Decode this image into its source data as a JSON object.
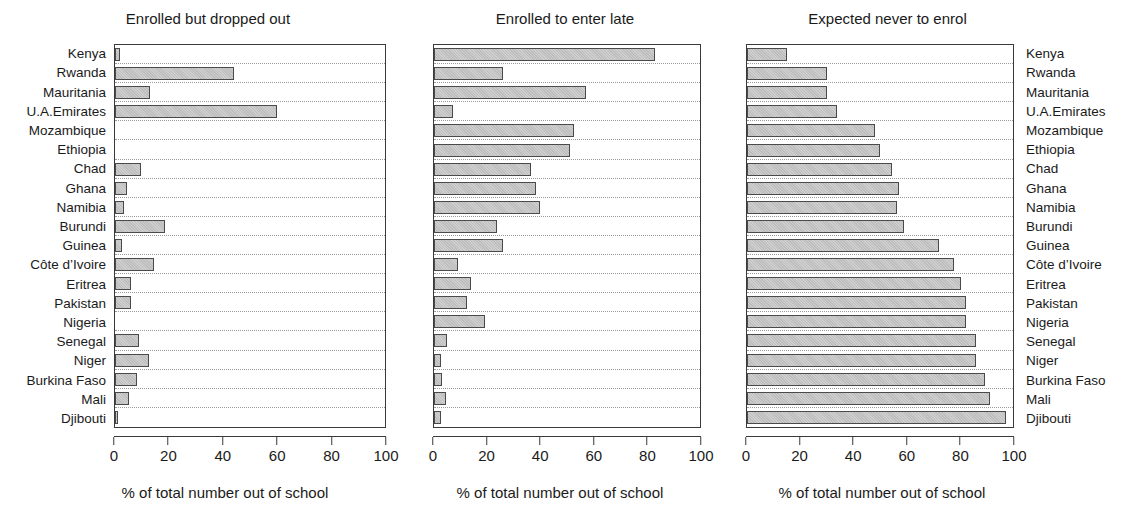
{
  "figure": {
    "xaxis_title": "% of total number out of school",
    "xticks": [
      0,
      20,
      40,
      60,
      80,
      100
    ],
    "xlim": [
      0,
      100
    ],
    "categories": [
      "Kenya",
      "Rwanda",
      "Mauritania",
      "U.A.Emirates",
      "Mozambique",
      "Ethiopia",
      "Chad",
      "Ghana",
      "Namibia",
      "Burundi",
      "Guinea",
      "Côte d’Ivoire",
      "Eritrea",
      "Pakistan",
      "Nigeria",
      "Senegal",
      "Niger",
      "Burkina Faso",
      "Mali",
      "Djibouti"
    ],
    "panel_titles": [
      "Enrolled but dropped out",
      "Enrolled to enter late",
      "Expected never to enrol"
    ],
    "colors": {
      "bar_fill": "#c6c6c6",
      "bar_edge": "#4a4a4a",
      "axis": "#3a3a3a",
      "gridline": "#9a9a9a",
      "background": "#ffffff",
      "text": "#1a1a1a"
    }
  },
  "chart_data": {
    "type": "bar",
    "orientation": "horizontal",
    "xlabel": "% of total number out of school",
    "ylabel": "",
    "xlim": [
      0,
      100
    ],
    "xticks": [
      0,
      20,
      40,
      60,
      80,
      100
    ],
    "grid": "dotted horizontal separators between categories",
    "legend": "none",
    "categories": [
      "Kenya",
      "Rwanda",
      "Mauritania",
      "U.A.Emirates",
      "Mozambique",
      "Ethiopia",
      "Chad",
      "Ghana",
      "Namibia",
      "Burundi",
      "Guinea",
      "Côte d’Ivoire",
      "Eritrea",
      "Pakistan",
      "Nigeria",
      "Senegal",
      "Niger",
      "Burkina Faso",
      "Mali",
      "Djibouti"
    ],
    "panels": [
      {
        "title": "Enrolled but dropped out",
        "values": [
          2,
          44,
          13,
          60,
          0,
          0,
          9.5,
          4.5,
          3.5,
          18.5,
          2.5,
          14.5,
          6,
          6,
          0,
          9,
          12.5,
          8,
          5,
          1
        ]
      },
      {
        "title": "Enrolled to enter late",
        "values": [
          83,
          26,
          57,
          7,
          52.5,
          51,
          36.5,
          38.5,
          40,
          23.5,
          26,
          9,
          14,
          12.5,
          19,
          5,
          2.5,
          3,
          4.5,
          2.5
        ]
      },
      {
        "title": "Expected never to enrol",
        "values": [
          15,
          30,
          30,
          34,
          48,
          50,
          54.5,
          57,
          56.5,
          59,
          72,
          78,
          80.5,
          82.5,
          82.5,
          86,
          86,
          89.5,
          91.5,
          97.5
        ]
      }
    ]
  }
}
